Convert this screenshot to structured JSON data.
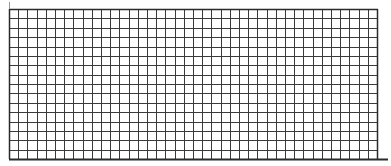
{
  "grid": {
    "columns": 40,
    "rows": 16,
    "left": 9,
    "top": 9,
    "width": 368,
    "height": 150,
    "line_color": "#3a3a3a",
    "border_color": "#2a2a2a",
    "background": "#ffffff",
    "bottom_extension_to": 388,
    "top_tick": {
      "x": 9,
      "y1": 2,
      "y2": 9
    }
  }
}
